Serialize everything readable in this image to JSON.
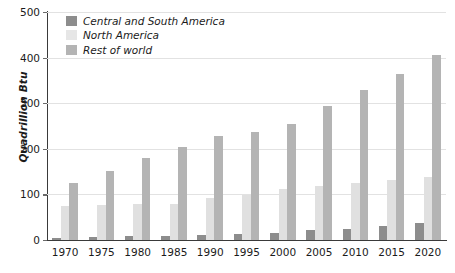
{
  "chart_data": {
    "type": "bar",
    "title": "",
    "subtitle": "",
    "xlabel": "",
    "ylabel": "Quadrillion Btu",
    "categories": [
      "1970",
      "1975",
      "1980",
      "1985",
      "1990",
      "1995",
      "2000",
      "2005",
      "2010",
      "2015",
      "2020"
    ],
    "series": [
      {
        "name": "Central and South America",
        "color": "#8d8d8d",
        "values": [
          5,
          6,
          9,
          9,
          12,
          13,
          16,
          21,
          24,
          31,
          38
        ]
      },
      {
        "name": "North America",
        "color": "#e0e0e0",
        "values": [
          74,
          77,
          80,
          80,
          92,
          99,
          111,
          118,
          125,
          131,
          138
        ]
      },
      {
        "name": "Rest of world",
        "color": "#b4b4b4",
        "values": [
          124,
          152,
          180,
          203,
          229,
          237,
          254,
          293,
          330,
          364,
          405
        ]
      }
    ],
    "yticks": [
      0,
      100,
      200,
      300,
      400,
      500
    ],
    "ylim": [
      0,
      500
    ],
    "grid": true,
    "legend_position": "top-left"
  },
  "legend": {
    "items": [
      {
        "label": "Central and South America",
        "swatch": "s0"
      },
      {
        "label": "North America",
        "swatch": "s1"
      },
      {
        "label": "Rest of world",
        "swatch": "s2"
      }
    ]
  },
  "axis": {
    "y_title": "Quadrillion Btu",
    "y_labels": [
      "500",
      "400",
      "300",
      "200",
      "100",
      "0"
    ],
    "x_labels": [
      "1970",
      "1975",
      "1980",
      "1985",
      "1990",
      "1995",
      "2000",
      "2005",
      "2010",
      "2015",
      "2020"
    ]
  },
  "colors": {
    "series_0": "#8d8d8d",
    "series_1": "#e0e0e0",
    "series_2": "#b4b4b4",
    "grid": "#e2e2e2",
    "axis": "#3a3a3a",
    "text": "#1b1b1b",
    "background": "#ffffff"
  }
}
